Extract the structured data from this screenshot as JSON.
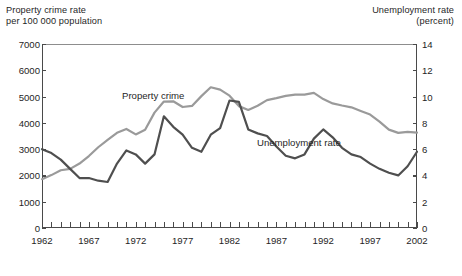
{
  "figure": {
    "left_axis_title": "Property crime rate\nper 100 000 population",
    "right_axis_title": "Unemployment rate\n(percent)",
    "series_label_crime": "Property crime",
    "series_label_unemployment": "Unemployment rate",
    "caption": ""
  },
  "chart_data": {
    "type": "line",
    "title": "",
    "xlabel": "",
    "ylabel": "Property crime rate per 100 000 population",
    "y2label": "Unemployment rate (percent)",
    "grid": false,
    "legend": "inline-annotations",
    "xlim": [
      1962,
      2002
    ],
    "ylim": [
      0,
      7000
    ],
    "y2lim": [
      0,
      14
    ],
    "yticks": [
      0,
      1000,
      2000,
      3000,
      4000,
      5000,
      6000,
      7000
    ],
    "y2ticks": [
      0,
      2,
      4,
      6,
      8,
      10,
      12,
      14
    ],
    "xticks_labeled": [
      1962,
      1967,
      1972,
      1977,
      1982,
      1987,
      1992,
      1997,
      2002
    ],
    "xticks_all_years": true,
    "colors": {
      "property_crime": "#9a9a9a",
      "unemployment": "#4f4f4f"
    },
    "x": [
      1962,
      1963,
      1964,
      1965,
      1966,
      1967,
      1968,
      1969,
      1970,
      1971,
      1972,
      1973,
      1974,
      1975,
      1976,
      1977,
      1978,
      1979,
      1980,
      1981,
      1982,
      1983,
      1984,
      1985,
      1986,
      1987,
      1988,
      1989,
      1990,
      1991,
      1992,
      1993,
      1994,
      1995,
      1996,
      1997,
      1998,
      1999,
      2000,
      2001,
      2002
    ],
    "series": [
      {
        "name": "Property crime",
        "axis": "left",
        "unit": "per 100 000 population",
        "color": "#9a9a9a",
        "values": [
          1858,
          2012,
          2198,
          2249,
          2451,
          2737,
          3072,
          3351,
          3621,
          3769,
          3561,
          3737,
          4390,
          4811,
          4820,
          4602,
          4643,
          5017,
          5353,
          5264,
          5033,
          4637,
          4492,
          4651,
          4863,
          4940,
          5027,
          5077,
          5073,
          5140,
          4903,
          4740,
          4660,
          4591,
          4451,
          4316,
          4049,
          3744,
          3618,
          3658,
          3625
        ]
      },
      {
        "name": "Unemployment rate",
        "axis": "right",
        "unit": "percent",
        "color": "#4f4f4f",
        "values": [
          6.0,
          5.7,
          5.2,
          4.5,
          3.8,
          3.8,
          3.6,
          3.5,
          4.9,
          5.9,
          5.6,
          4.9,
          5.6,
          8.5,
          7.7,
          7.1,
          6.1,
          5.8,
          7.1,
          7.6,
          9.7,
          9.6,
          7.5,
          7.2,
          7.0,
          6.2,
          5.5,
          5.3,
          5.6,
          6.8,
          7.5,
          6.9,
          6.1,
          5.6,
          5.4,
          4.9,
          4.5,
          4.2,
          4.0,
          4.7,
          5.8
        ]
      }
    ]
  }
}
